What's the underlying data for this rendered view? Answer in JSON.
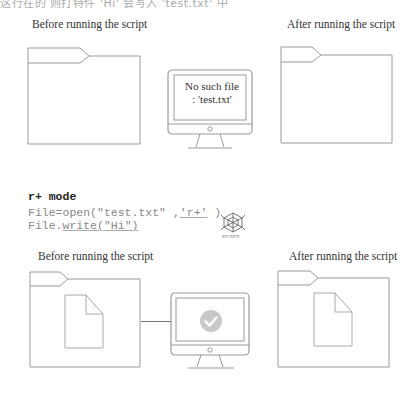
{
  "header_fragment": "这行在的 则打特件 'Hi' 会写入 'test.txt' 中",
  "scenario_1": {
    "before_caption": "Before running the script",
    "after_caption": "After running the script",
    "monitor_message_line1": "No such file",
    "monitor_message_line2": ": 'test.txt'"
  },
  "code": {
    "title": "r+ mode",
    "line1_prefix": "File=open(\"test.txt\" ,",
    "line1_arg": "'r+'",
    "line1_suffix": " )",
    "line2_prefix": "File.",
    "line2_method": "write",
    "line2_suffix": "(\"Hi\")",
    "logo_label": "SPYDER"
  },
  "scenario_2": {
    "before_caption": "Before running the script",
    "after_caption": "After running the script",
    "monitor_status": "success-check"
  },
  "colors": {
    "outline": "#9a9a9a",
    "check_circle": "#c8c8c8",
    "text": "#333333"
  }
}
